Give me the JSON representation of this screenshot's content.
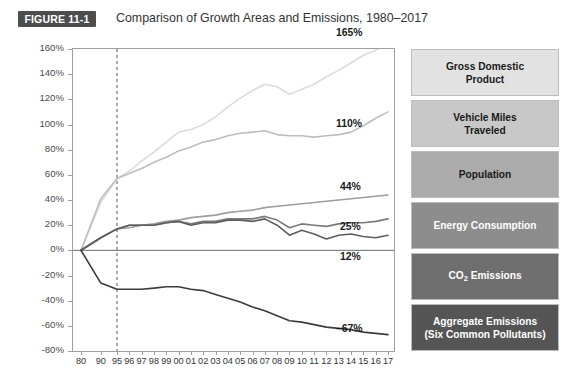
{
  "header": {
    "figure_tag": "FIGURE 11-1",
    "title": "Comparison of Growth Areas and Emissions, 1980–2017"
  },
  "legend": {
    "items": [
      {
        "label": "Gross Domestic Product",
        "line1": "Gross Domestic",
        "line2": "Product",
        "fill": "#e2e2e2",
        "text": "#1a1a1a"
      },
      {
        "label": "Vehicle Miles Traveled",
        "line1": "Vehicle Miles",
        "line2": "Traveled",
        "fill": "#c8c8c8",
        "text": "#1a1a1a"
      },
      {
        "label": "Population",
        "line1": "Population",
        "line2": "",
        "fill": "#ababab",
        "text": "#1a1a1a"
      },
      {
        "label": "Energy Consumption",
        "line1": "Energy Consumption",
        "line2": "",
        "fill": "#8d8d8d",
        "text": "#ffffff"
      },
      {
        "label": "CO2 Emissions",
        "line1": "CO",
        "line2": " Emissions",
        "sub": "2",
        "fill": "#6e6e6e",
        "text": "#ffffff"
      },
      {
        "label": "Aggregate Emissions (Six Common Pollutants)",
        "line1": "Aggregate Emissions",
        "line2": "(Six Common Pollutants)",
        "fill": "#555555",
        "text": "#ffffff"
      }
    ]
  },
  "chart_data": {
    "type": "line",
    "title": "Comparison of Growth Areas and Emissions, 1980–2017",
    "xlabel": "",
    "ylabel": "",
    "ylim": [
      -80,
      160
    ],
    "yticks": [
      "160%",
      "140%",
      "120%",
      "100%",
      "80%",
      "60%",
      "40%",
      "20%",
      "0%",
      "-20%",
      "-40%",
      "-60%",
      "-80%"
    ],
    "ytick_values": [
      160,
      140,
      120,
      100,
      80,
      60,
      40,
      20,
      0,
      -20,
      -40,
      -60,
      -80
    ],
    "grid": false,
    "legend_position": "right",
    "reference_line_x": "95",
    "zero_line": true,
    "x": [
      "80",
      "90",
      "95",
      "96",
      "97",
      "98",
      "99",
      "00",
      "01",
      "02",
      "03",
      "04",
      "05",
      "06",
      "07",
      "08",
      "09",
      "10",
      "11",
      "12",
      "13",
      "14",
      "15",
      "16",
      "17"
    ],
    "series": [
      {
        "name": "Gross Domestic Product",
        "color": "#dcdcdc",
        "end_label": "165%",
        "values": [
          0,
          38,
          57,
          63,
          71,
          78,
          86,
          94,
          96,
          100,
          106,
          114,
          121,
          127,
          132,
          130,
          124,
          128,
          132,
          138,
          143,
          149,
          155,
          159,
          165
        ]
      },
      {
        "name": "Vehicle Miles Traveled",
        "color": "#bdbdbd",
        "end_label": "110%",
        "values": [
          0,
          41,
          57,
          61,
          65,
          70,
          74,
          79,
          82,
          86,
          88,
          91,
          93,
          94,
          95,
          92,
          91,
          91,
          90,
          91,
          92,
          94,
          99,
          105,
          110
        ]
      },
      {
        "name": "Population",
        "color": "#9e9e9e",
        "end_label": "44%",
        "values": [
          0,
          10,
          17,
          18,
          20,
          21,
          23,
          24,
          26,
          27,
          28,
          30,
          31,
          32,
          34,
          35,
          36,
          37,
          38,
          39,
          40,
          41,
          42,
          43,
          44
        ]
      },
      {
        "name": "Energy Consumption",
        "color": "#7a7a7a",
        "end_label": "25%",
        "values": [
          0,
          10,
          17,
          20,
          20,
          20,
          22,
          23,
          21,
          23,
          23,
          25,
          25,
          25,
          27,
          24,
          18,
          21,
          20,
          19,
          21,
          22,
          22,
          23,
          25
        ]
      },
      {
        "name": "CO2 Emissions",
        "color": "#5e5e5e",
        "end_label": "12%",
        "values": [
          0,
          10,
          17,
          20,
          20,
          20,
          22,
          23,
          20,
          22,
          22,
          24,
          24,
          23,
          25,
          20,
          12,
          16,
          13,
          9,
          12,
          13,
          11,
          10,
          12
        ]
      },
      {
        "name": "Aggregate Emissions (Six Common Pollutants)",
        "color": "#3c3c3c",
        "end_label": "–67%",
        "values": [
          0,
          -26,
          -31,
          -31,
          -31,
          -30,
          -29,
          -29,
          -31,
          -32,
          -35,
          -38,
          -41,
          -45,
          -48,
          -52,
          -56,
          -57,
          -59,
          -61,
          -62,
          -63,
          -65,
          -66,
          -67
        ]
      }
    ]
  }
}
